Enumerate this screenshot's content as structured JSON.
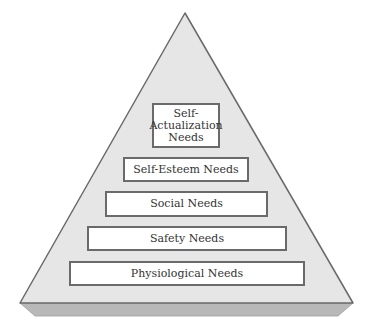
{
  "diagram": {
    "type": "pyramid",
    "colors": {
      "face": "#e6e6e6",
      "outline": "#6a6a6a",
      "base_slab": "#b8b8b8",
      "box_fill": "#ffffff",
      "box_border": "#6a6a6a",
      "text": "#333333"
    },
    "tiers": [
      {
        "label": "Self-Actualization Needs",
        "lines": [
          "Self-",
          "Actualization",
          "Needs"
        ],
        "level": 5
      },
      {
        "label": "Self-Esteem Needs",
        "level": 4
      },
      {
        "label": "Social Needs",
        "level": 3
      },
      {
        "label": "Safety Needs",
        "level": 2
      },
      {
        "label": "Physiological Needs",
        "level": 1
      }
    ]
  }
}
